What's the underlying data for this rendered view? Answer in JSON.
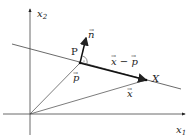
{
  "diagram": {
    "axes": {
      "x_label": "x",
      "x_sub": "1",
      "y_label": "x",
      "y_sub": "2"
    },
    "points": {
      "P": "P",
      "X": "X"
    },
    "vectors": {
      "n": "n",
      "p": "p",
      "x": "x",
      "x_minus_p": "x − p"
    },
    "colors": {
      "stroke": "#222222",
      "background": "#ffffff"
    }
  }
}
